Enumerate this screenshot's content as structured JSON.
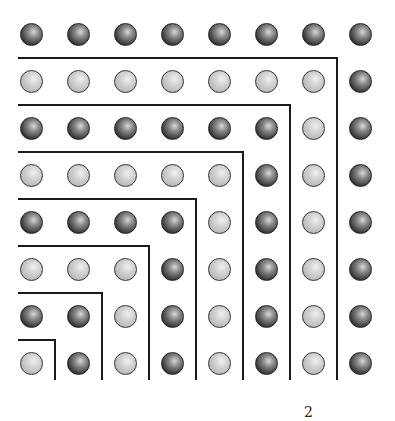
{
  "diagram": {
    "title": "",
    "grid_size": 8,
    "origin": "bottom-left",
    "layers": [
      {
        "index": 1,
        "count": 1,
        "shade": "light"
      },
      {
        "index": 2,
        "count": 3,
        "shade": "dark"
      },
      {
        "index": 3,
        "count": 5,
        "shade": "light"
      },
      {
        "index": 4,
        "count": 7,
        "shade": "dark"
      },
      {
        "index": 5,
        "count": 9,
        "shade": "light"
      },
      {
        "index": 6,
        "count": 11,
        "shade": "dark"
      },
      {
        "index": 7,
        "count": 13,
        "shade": "light"
      },
      {
        "index": 8,
        "count": 15,
        "shade": "dark"
      }
    ],
    "colors": {
      "dark": "#2a2a2a",
      "light": "#c4c4c4",
      "line": "#1a1a1a"
    },
    "caption_fragment": "2"
  }
}
